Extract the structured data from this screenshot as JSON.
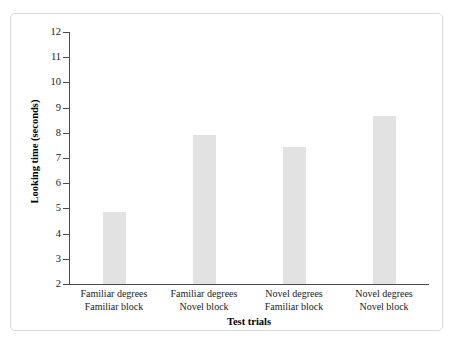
{
  "figure": {
    "artifact_text": "",
    "background_color": "#ffffff",
    "frame_color": "#d8d8d8"
  },
  "chart_data": {
    "type": "bar",
    "title": "",
    "xlabel": "Test trials",
    "ylabel": "Looking time (seconds)",
    "categories": [
      "Familiar degrees\nFamiliar block",
      "Familiar degrees\nNovel block",
      "Novel degrees\nFamiliar block",
      "Novel degrees\nNovel block"
    ],
    "category_lines": [
      {
        "line1": "Familiar degrees",
        "line2": "Familiar block"
      },
      {
        "line1": "Familiar degrees",
        "line2": "Novel block"
      },
      {
        "line1": "Novel degrees",
        "line2": "Familiar block"
      },
      {
        "line1": "Novel degrees",
        "line2": "Novel block"
      }
    ],
    "values": [
      4.85,
      7.9,
      7.45,
      8.65
    ],
    "ylim": [
      2,
      12
    ],
    "ytick_labels": [
      "12",
      "11",
      "10",
      "9",
      "8",
      "7",
      "6",
      "5",
      "4",
      "3",
      "2"
    ],
    "ytick_values": [
      12,
      11,
      10,
      9,
      8,
      7,
      6,
      5,
      4,
      3,
      2
    ],
    "grid": false,
    "legend": false,
    "bar_color": "#e2e2e2",
    "axis_color": "#4a4a4a"
  }
}
